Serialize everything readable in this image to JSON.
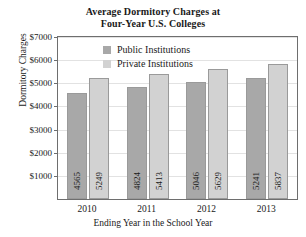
{
  "chart_data": {
    "type": "bar",
    "title": "Average Dormitory Charges at Four-Year U.S. Colleges",
    "title_lines": [
      "Average Dormitory Charges at",
      "Four-Year U.S. Colleges"
    ],
    "xlabel": "Ending Year in the School Year",
    "ylabel": "Dormitory Charges",
    "categories": [
      "2010",
      "2011",
      "2012",
      "2013"
    ],
    "series": [
      {
        "name": "Public Institutions",
        "color": "#a8a8a8",
        "values": [
          4565,
          4824,
          5046,
          5241
        ],
        "labels": [
          "4565",
          "4824",
          "5046",
          "5241"
        ]
      },
      {
        "name": "Private Institutions",
        "color": "#d2d2d2",
        "values": [
          5249,
          5413,
          5629,
          5837
        ],
        "labels": [
          "5249",
          "5413",
          "5629",
          "5837"
        ]
      }
    ],
    "ylim": [
      0,
      7000
    ],
    "ytick_values": [
      7000,
      6000,
      5000,
      4000,
      3000,
      2000,
      1000
    ],
    "ytick_labels": [
      "$7000",
      "$6000",
      "$5000",
      "$4000",
      "$3000",
      "$2000",
      "$1000"
    ],
    "grid": true,
    "legend_position": "top-left-inside",
    "axis_color": "#6e6e6e",
    "grid_color": "#e2e2e2"
  }
}
